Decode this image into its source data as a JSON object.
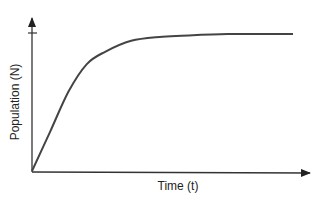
{
  "chart_data": {
    "type": "line",
    "title": "",
    "xlabel": "Time (t)",
    "ylabel": "Population (N)",
    "grid": false,
    "legend": null,
    "axis_ticks": {
      "x": [],
      "y": [
        "carrying-capacity tick (unlabeled)"
      ]
    },
    "series": [
      {
        "name": "Population",
        "x": [
          0,
          0.07,
          0.14,
          0.21,
          0.28,
          0.38,
          0.5,
          0.6,
          0.75,
          0.9,
          1.0
        ],
        "y": [
          0,
          0.29,
          0.58,
          0.78,
          0.87,
          0.95,
          0.98,
          0.99,
          1.0,
          1.0,
          1.0
        ]
      }
    ],
    "xlim": [
      0,
      1
    ],
    "ylim": [
      0,
      1.1
    ]
  },
  "colors": {
    "curve": "#444444",
    "axes": "#333333",
    "text": "#222222",
    "background": "#ffffff"
  }
}
